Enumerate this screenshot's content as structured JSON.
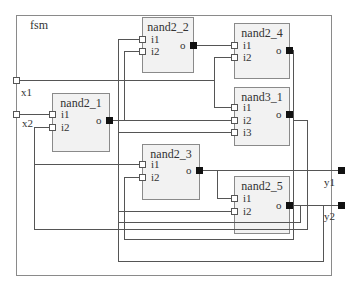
{
  "diagram": {
    "type": "schematic",
    "module": {
      "name": "fsm"
    },
    "colors": {
      "wire": "#555555",
      "frame": "#8a8a8a",
      "block_fill": "#f2f2f2",
      "input_pin_fill": "#ffffff",
      "output_pin_fill": "#111111"
    },
    "ports": {
      "x1": {
        "label": "x1",
        "direction": "input"
      },
      "x2": {
        "label": "x2",
        "direction": "input"
      },
      "y1": {
        "label": "y1",
        "direction": "output"
      },
      "y2": {
        "label": "y2",
        "direction": "output"
      }
    },
    "blocks": {
      "nand2_1": {
        "label": "nand2_1",
        "inputs": [
          "i1",
          "i2"
        ],
        "output": "o"
      },
      "nand2_2": {
        "label": "nand2_2",
        "inputs": [
          "i1",
          "i2"
        ],
        "output": "o"
      },
      "nand2_3": {
        "label": "nand2_3",
        "inputs": [
          "i1",
          "i2"
        ],
        "output": "o"
      },
      "nand2_4": {
        "label": "nand2_4",
        "inputs": [
          "i1",
          "i2"
        ],
        "output": "o"
      },
      "nand2_5": {
        "label": "nand2_5",
        "inputs": [
          "i1",
          "i2"
        ],
        "output": "o"
      },
      "nand3_1": {
        "label": "nand3_1",
        "inputs": [
          "i1",
          "i2",
          "i3"
        ],
        "output": "o"
      }
    },
    "pin_labels": {
      "i1": "i1",
      "i2": "i2",
      "i3": "i3",
      "o": "o"
    }
  }
}
